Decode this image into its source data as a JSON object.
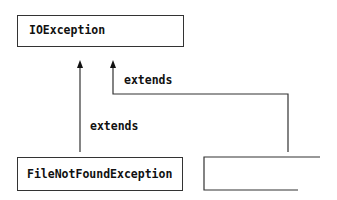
{
  "diagram": {
    "nodes": [
      {
        "id": "ioexception",
        "label": "IOException"
      },
      {
        "id": "filenotfound",
        "label": "FileNotFoundException"
      },
      {
        "id": "unnamed",
        "label": ""
      }
    ],
    "edges": [
      {
        "from": "filenotfound",
        "to": "ioexception",
        "label": "extends"
      },
      {
        "from": "unnamed",
        "to": "ioexception",
        "label": "extends"
      }
    ],
    "colors": {
      "stroke": "#333333",
      "text": "#111111",
      "background": "#ffffff"
    }
  }
}
